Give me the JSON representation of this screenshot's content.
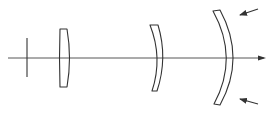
{
  "diagram": {
    "type": "optical-lens-system",
    "colors": {
      "line": "#333333",
      "axis": "#444444",
      "background": "#ffffff"
    },
    "elements": [
      {
        "id": "aperture-stop",
        "kind": "stop"
      },
      {
        "id": "lens-1",
        "kind": "thick-lens"
      },
      {
        "id": "lens-2",
        "kind": "meniscus-lens"
      },
      {
        "id": "lens-3",
        "kind": "large-meniscus-lens"
      }
    ],
    "arrows": [
      {
        "id": "arrow-top",
        "direction": "down-left"
      },
      {
        "id": "arrow-bottom",
        "direction": "up-left"
      },
      {
        "id": "axis-arrow",
        "direction": "right"
      }
    ]
  }
}
